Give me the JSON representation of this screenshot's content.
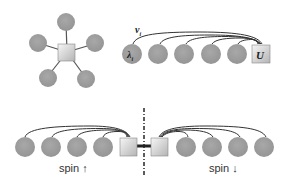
{
  "diagram": {
    "star_panel": {
      "description": "Star geometry: impurity square connected to 5 bath sites",
      "center": "impurity-square",
      "satellites": 5
    },
    "chain_panel": {
      "hopping_label": "v",
      "hopping_subscript": "i",
      "site_label": "λ",
      "site_subscript": "i",
      "impurity_label": "U",
      "bath_sites": 5
    },
    "spin_panel": {
      "left_label": "spin ↑",
      "right_label": "spin ↓",
      "left_sites": 4,
      "right_sites": 4
    },
    "colors": {
      "site_fill": "#9e9e9e",
      "line": "#333333",
      "impurity_light": "#f4f4f4",
      "impurity_dark": "#b8b8b8"
    }
  }
}
